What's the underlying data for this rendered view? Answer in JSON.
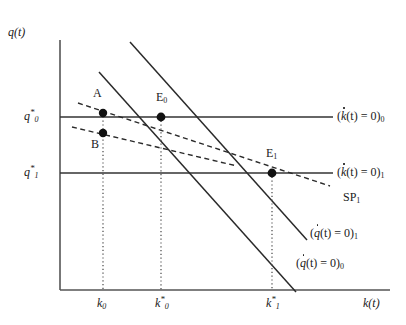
{
  "figure": {
    "width": 406,
    "height": 325,
    "background": "#ffffff",
    "line_color": "#1a1a1a",
    "text_color": "#1a1a1a"
  },
  "axes": {
    "y_label": "q(t)",
    "x_label": "k(t)",
    "y_axis_x": 60,
    "x_axis_y": 290,
    "y_axis_top": 40,
    "x_axis_right": 390
  },
  "y_ticks": [
    {
      "label_main": "q",
      "label_sup": "*",
      "label_sub": "0",
      "value_y": 117
    },
    {
      "label_main": "q",
      "label_sup": "*",
      "label_sub": "1",
      "value_y": 173
    }
  ],
  "x_ticks": [
    {
      "label_main": "k",
      "label_sup": "",
      "label_sub": "0",
      "value_x": 103
    },
    {
      "label_main": "k",
      "label_sup": "*",
      "label_sub": "0",
      "value_x": 161
    },
    {
      "label_main": "k",
      "label_sup": "*",
      "label_sub": "1",
      "value_x": 272
    }
  ],
  "curves": {
    "kdot0": {
      "label_var": "k",
      "label_eq": "(",
      "label_body": "(t) = 0)",
      "label_sub": "0",
      "y": 117,
      "x_start": 60,
      "x_end": 333
    },
    "kdot1": {
      "label_var": "k",
      "label_body": "(t) = 0)",
      "label_sub": "1",
      "y": 173,
      "x_start": 60,
      "x_end": 333
    },
    "qdot0": {
      "label_var": "q",
      "label_body": "(t) = 0)",
      "label_sub": "0",
      "x1": 130,
      "y1": 42,
      "x2": 307,
      "y2": 240
    },
    "qdot1": {
      "label_var": "q",
      "label_body": "(t) = 0)",
      "label_sub": "1",
      "x1": 99,
      "y1": 72,
      "x2": 296,
      "y2": 292
    },
    "sp1": {
      "label": "SP",
      "label_sub": "1"
    }
  },
  "saddle_paths": [
    {
      "name": "sp-upper",
      "x1": 78,
      "y1": 103,
      "x2": 330,
      "y2": 186,
      "style": "dashed"
    },
    {
      "name": "sp-lower",
      "x1": 72,
      "y1": 127,
      "x2": 237,
      "y2": 166,
      "style": "dashed"
    }
  ],
  "points": [
    {
      "label": "A",
      "x": 103,
      "y": 113,
      "label_x": 93,
      "label_y": 88
    },
    {
      "label": "B",
      "x": 103,
      "y": 133,
      "label_x": 91,
      "label_y": 138
    },
    {
      "label": "E",
      "label_sub": "0",
      "x": 161,
      "y": 117,
      "label_x": 156,
      "label_y": 92
    },
    {
      "label": "E",
      "label_sub": "1",
      "x": 272,
      "y": 173,
      "label_x": 266,
      "label_y": 148
    }
  ],
  "curve_labels": {
    "kdot0_x": 337,
    "kdot0_y": 110,
    "kdot1_x": 337,
    "kdot1_y": 166,
    "sp1_x": 340,
    "sp1_y": 192,
    "qdot1_x": 313,
    "qdot1_y": 228,
    "qdot0_x": 297,
    "qdot0_y": 258
  }
}
